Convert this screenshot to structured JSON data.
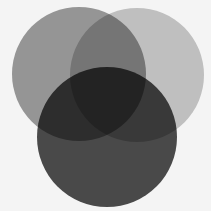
{
  "diagram": {
    "type": "venn",
    "background": "#f4f4f4",
    "circles": [
      {
        "id": "left",
        "cx": 79,
        "cy": 74,
        "r": 67,
        "color": "#9c9c9c"
      },
      {
        "id": "right",
        "cx": 137,
        "cy": 75,
        "r": 67,
        "color": "#c8c8c8"
      },
      {
        "id": "bottom",
        "cx": 107,
        "cy": 137,
        "r": 70,
        "color": "#4c4c4c"
      }
    ]
  }
}
